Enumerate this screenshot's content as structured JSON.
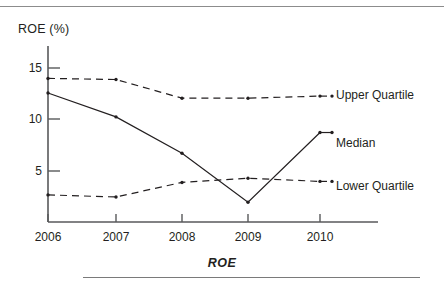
{
  "figure": {
    "y_axis_title": "ROE (%)",
    "caption": "ROE"
  },
  "legend": {
    "upper": "Upper Quartile",
    "median": "Median",
    "lower": "Lower Quartile"
  },
  "axis": {
    "y_ticks": [
      "15",
      "10",
      "5"
    ],
    "x_ticks": [
      "2006",
      "2007",
      "2008",
      "2009",
      "2010"
    ]
  },
  "chart_data": {
    "type": "line",
    "title": "",
    "subtitle": "",
    "xlabel": "",
    "ylabel": "ROE (%)",
    "caption": "ROE",
    "x": [
      "2006",
      "2007",
      "2008",
      "2009",
      "2010"
    ],
    "categories": [
      "2006",
      "2007",
      "2008",
      "2009",
      "2010"
    ],
    "xlim": [
      "2006",
      "2010"
    ],
    "ylim": [
      0,
      16.5
    ],
    "y_ticks": [
      5,
      10,
      15
    ],
    "grid": false,
    "legend_position": "right-inline",
    "series": [
      {
        "name": "Upper Quartile",
        "style": "dashed",
        "marker": "dot",
        "color": "#231f20",
        "values": [
          13.9,
          13.8,
          12.0,
          12.0,
          12.2
        ]
      },
      {
        "name": "Median",
        "style": "solid",
        "marker": "dot",
        "color": "#231f20",
        "values": [
          12.5,
          10.2,
          6.7,
          2.0,
          8.7
        ]
      },
      {
        "name": "Lower Quartile",
        "style": "dashed",
        "marker": "dot",
        "color": "#231f20",
        "values": [
          2.7,
          2.5,
          3.9,
          4.3,
          4.0
        ]
      }
    ]
  }
}
